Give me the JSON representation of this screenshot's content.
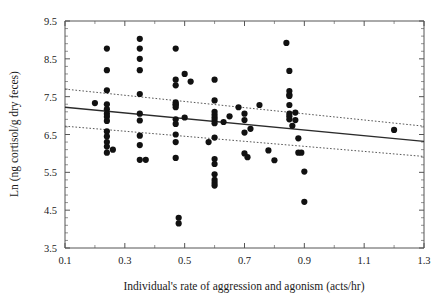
{
  "figure": {
    "width": 446,
    "height": 308,
    "background": "#ffffff",
    "marker_color": "#111111",
    "line_color": "#2b2b2b",
    "ci_color": "#444444",
    "axis_color": "#555555"
  },
  "axes": {
    "x_title": "Individual's rate of aggression and agonism (acts/hr)",
    "y_title": "Ln (ng cortisol/g dry feces)",
    "x_ticks": [
      "0.1",
      "0.3",
      "0.5",
      "0.7",
      "0.9",
      "1.1",
      "1.3"
    ],
    "y_ticks": [
      "9.5",
      "8.5",
      "7.5",
      "6.5",
      "5.5",
      "4.5",
      "3.5"
    ]
  },
  "chart_data": {
    "type": "scatter",
    "title": "",
    "xlabel": "Individual's rate of aggression and agonism (acts/hr)",
    "ylabel": "Ln (ng cortisol/g dry feces)",
    "xlim": [
      0.1,
      1.3
    ],
    "ylim": [
      3.5,
      9.5
    ],
    "x_tick_values": [
      0.1,
      0.3,
      0.5,
      0.7,
      0.9,
      1.1,
      1.3
    ],
    "y_tick_values": [
      3.5,
      4.5,
      5.5,
      6.5,
      7.5,
      8.5,
      9.5
    ],
    "x_minor_step": 0.1,
    "y_minor_step": 0.2,
    "grid": false,
    "legend": null,
    "points": [
      [
        0.2,
        7.33
      ],
      [
        0.24,
        8.77
      ],
      [
        0.24,
        8.2
      ],
      [
        0.24,
        7.67
      ],
      [
        0.24,
        7.3
      ],
      [
        0.24,
        7.17
      ],
      [
        0.24,
        7.05
      ],
      [
        0.24,
        6.97
      ],
      [
        0.24,
        6.86
      ],
      [
        0.24,
        6.58
      ],
      [
        0.24,
        6.45
      ],
      [
        0.24,
        6.3
      ],
      [
        0.24,
        6.18
      ],
      [
        0.24,
        6.02
      ],
      [
        0.26,
        6.1
      ],
      [
        0.35,
        9.03
      ],
      [
        0.35,
        8.77
      ],
      [
        0.35,
        8.5
      ],
      [
        0.35,
        8.2
      ],
      [
        0.35,
        7.57
      ],
      [
        0.35,
        7.05
      ],
      [
        0.35,
        6.87
      ],
      [
        0.35,
        6.47
      ],
      [
        0.35,
        6.22
      ],
      [
        0.35,
        5.83
      ],
      [
        0.37,
        5.83
      ],
      [
        0.47,
        8.77
      ],
      [
        0.47,
        7.95
      ],
      [
        0.47,
        7.8
      ],
      [
        0.47,
        7.35
      ],
      [
        0.47,
        7.3
      ],
      [
        0.47,
        7.28
      ],
      [
        0.47,
        7.22
      ],
      [
        0.47,
        6.9
      ],
      [
        0.47,
        6.78
      ],
      [
        0.47,
        6.5
      ],
      [
        0.47,
        6.3
      ],
      [
        0.47,
        5.88
      ],
      [
        0.48,
        4.3
      ],
      [
        0.48,
        4.15
      ],
      [
        0.5,
        8.1
      ],
      [
        0.5,
        6.95
      ],
      [
        0.52,
        7.9
      ],
      [
        0.58,
        6.3
      ],
      [
        0.6,
        7.95
      ],
      [
        0.6,
        7.4
      ],
      [
        0.6,
        7.1
      ],
      [
        0.6,
        7.02
      ],
      [
        0.6,
        6.95
      ],
      [
        0.6,
        6.88
      ],
      [
        0.6,
        6.8
      ],
      [
        0.6,
        6.42
      ],
      [
        0.6,
        5.85
      ],
      [
        0.6,
        5.72
      ],
      [
        0.6,
        5.45
      ],
      [
        0.6,
        5.3
      ],
      [
        0.6,
        5.22
      ],
      [
        0.6,
        5.15
      ],
      [
        0.63,
        6.83
      ],
      [
        0.65,
        6.98
      ],
      [
        0.68,
        7.22
      ],
      [
        0.7,
        7.05
      ],
      [
        0.7,
        6.88
      ],
      [
        0.7,
        6.55
      ],
      [
        0.7,
        6.0
      ],
      [
        0.71,
        5.9
      ],
      [
        0.72,
        6.65
      ],
      [
        0.75,
        7.28
      ],
      [
        0.78,
        6.08
      ],
      [
        0.8,
        5.82
      ],
      [
        0.84,
        8.92
      ],
      [
        0.85,
        8.18
      ],
      [
        0.85,
        7.65
      ],
      [
        0.85,
        7.55
      ],
      [
        0.85,
        7.52
      ],
      [
        0.85,
        7.28
      ],
      [
        0.85,
        7.05
      ],
      [
        0.85,
        6.98
      ],
      [
        0.85,
        6.9
      ],
      [
        0.86,
        6.73
      ],
      [
        0.87,
        7.08
      ],
      [
        0.87,
        6.88
      ],
      [
        0.88,
        6.4
      ],
      [
        0.88,
        6.02
      ],
      [
        0.89,
        6.02
      ],
      [
        0.9,
        5.52
      ],
      [
        0.9,
        4.72
      ],
      [
        1.2,
        6.62
      ]
    ],
    "fit_line": {
      "label": "regression line",
      "x": [
        0.1,
        1.3
      ],
      "y": [
        7.22,
        6.32
      ]
    },
    "confidence_band_upper": {
      "label": "upper confidence limit",
      "x": [
        0.1,
        1.3
      ],
      "y": [
        7.7,
        6.72
      ]
    },
    "confidence_band_lower": {
      "label": "lower confidence limit",
      "x": [
        0.1,
        1.3
      ],
      "y": [
        6.72,
        5.92
      ]
    }
  }
}
